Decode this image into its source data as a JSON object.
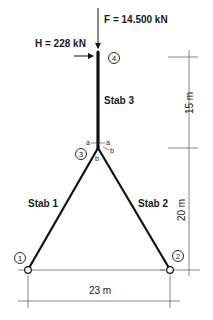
{
  "loads": {
    "vertical": {
      "label": "F = 14.500 kN"
    },
    "horizontal": {
      "label": "H = 228 kN"
    }
  },
  "members": [
    {
      "id": "stab1",
      "label": "Stab 1"
    },
    {
      "id": "stab2",
      "label": "Stab 2"
    },
    {
      "id": "stab3",
      "label": "Stab 3"
    }
  ],
  "nodes": [
    {
      "id": "1",
      "label": "1"
    },
    {
      "id": "2",
      "label": "2"
    },
    {
      "id": "3",
      "label": "3"
    },
    {
      "id": "4",
      "label": "4"
    }
  ],
  "section_marks": {
    "a_left": "a",
    "a_right": "a",
    "b_right": "b",
    "b_lower": "b"
  },
  "dimensions": {
    "upper_height": "15 m",
    "lower_height": "20 m",
    "base_width": "23 m"
  },
  "colors": {
    "member": "#111111",
    "dimension_line": "#555555",
    "background": "#ffffff"
  }
}
